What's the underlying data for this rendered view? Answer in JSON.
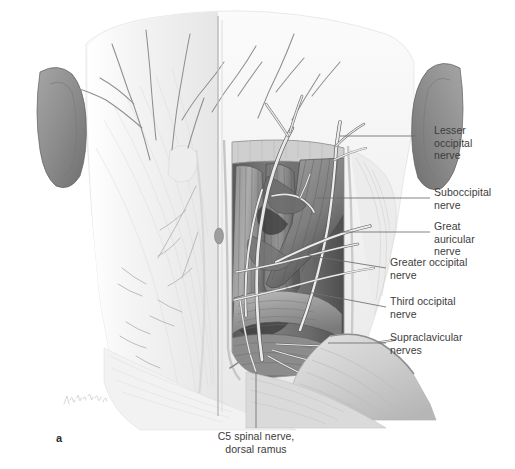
{
  "figure": {
    "panel_letter": "a",
    "background_color": "#ffffff",
    "label_color": "#3c3c3c",
    "leader_color": "#6e6e6e",
    "width": 515,
    "height": 469
  },
  "labels": [
    {
      "id": "lesser-occipital-nerve",
      "text": "Lesser\noccipital\nnerve",
      "x": 434,
      "y": 130,
      "leader": {
        "x1": 416,
        "y1": 136,
        "x2": 340,
        "y2": 136
      }
    },
    {
      "id": "suboccipital-nerve",
      "text": "Suboccipital\nnerve",
      "x": 434,
      "y": 192,
      "leader": {
        "x1": 430,
        "y1": 198,
        "x2": 316,
        "y2": 198
      }
    },
    {
      "id": "great-auricular-nerve",
      "text": "Great\nauricular\nnerve",
      "x": 434,
      "y": 226,
      "leader": {
        "x1": 430,
        "y1": 232,
        "x2": 340,
        "y2": 232
      }
    },
    {
      "id": "greater-occipital-nerve",
      "text": "Greater occipital\nnerve",
      "x": 390,
      "y": 262,
      "leader": {
        "x1": 386,
        "y1": 268,
        "x2": 300,
        "y2": 254
      }
    },
    {
      "id": "third-occipital-nerve",
      "text": "Third occipital\nnerve",
      "x": 390,
      "y": 301,
      "leader": {
        "x1": 386,
        "y1": 307,
        "x2": 286,
        "y2": 288
      }
    },
    {
      "id": "supraclavicular-nerves",
      "text": "Supraclavicular\nnerves",
      "x": 390,
      "y": 337,
      "leader": {
        "x1": 386,
        "y1": 343,
        "x2": 328,
        "y2": 343
      }
    }
  ],
  "caption": {
    "id": "c5-spinal-nerve",
    "text": "C5 spinal nerve,\ndorsal ramus",
    "x": 205,
    "y": 436,
    "leader": {
      "x1": 256,
      "y1": 371,
      "x2": 256,
      "y2": 428
    }
  },
  "illustration": {
    "title": "Posterior neck dissection, superficial and deep nerves",
    "palette": {
      "skin_light": "#f7f7f7",
      "fascia": "#ececec",
      "muscle_mid": "#9a9a9a",
      "muscle_dark": "#5e5e5e",
      "muscle_deep": "#3f3f3f",
      "ear": "#8d8d8d",
      "nerve": "#e9e9e9",
      "nerve_outline": "#6b6b6b",
      "vessel": "#555555"
    },
    "regions": [
      {
        "name": "occipital-scalp",
        "shade": "#f5f5f5"
      },
      {
        "name": "left-ear",
        "shade": "#8d8d8d"
      },
      {
        "name": "right-ear",
        "shade": "#8d8d8d"
      },
      {
        "name": "left-superficial-fascia",
        "shade": "#f2f2f2"
      },
      {
        "name": "midline-raphe",
        "shade": "#cccccc"
      },
      {
        "name": "dissection-window",
        "shade": "#6f6f6f"
      },
      {
        "name": "trapezius",
        "shade": "#b4b4b4"
      },
      {
        "name": "splenius-capitis",
        "shade": "#8a8a8a"
      },
      {
        "name": "semispinalis-capitis",
        "shade": "#7a7a7a"
      },
      {
        "name": "shoulder-trapezius-flap",
        "shade": "#a8a8a8"
      }
    ],
    "signature": "artist-signature"
  }
}
